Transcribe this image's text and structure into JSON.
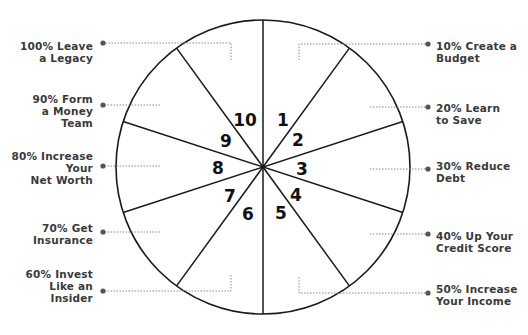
{
  "diagram": {
    "type": "wheel",
    "segments": 10,
    "center": [
      263,
      167
    ],
    "radius": 147,
    "colors": {
      "stroke": "#1a1a1a",
      "leader": "#8a8a8a",
      "dot": "#555555",
      "text": "#3a3a3a"
    },
    "slices": [
      {
        "number": "1",
        "label": "10% Create a\nBudget"
      },
      {
        "number": "2",
        "label": "20% Learn\nto Save"
      },
      {
        "number": "3",
        "label": "30% Reduce\nDebt"
      },
      {
        "number": "4",
        "label": "40% Up Your\nCredit Score"
      },
      {
        "number": "5",
        "label": "50% Increase\nYour Income"
      },
      {
        "number": "6",
        "label": "60% Invest\nLike an\nInsider"
      },
      {
        "number": "7",
        "label": "70% Get\nInsurance"
      },
      {
        "number": "8",
        "label": "80% Increase\nYour\nNet Worth"
      },
      {
        "number": "9",
        "label": "90% Form\na Money\nTeam"
      },
      {
        "number": "10",
        "label": "100% Leave\na Legacy"
      }
    ]
  }
}
